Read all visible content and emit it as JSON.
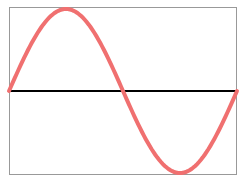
{
  "chart_data": {
    "type": "line",
    "title": "",
    "xlabel": "",
    "ylabel": "",
    "grid": false,
    "legend": null,
    "xlim": [
      0,
      6.2832
    ],
    "ylim": [
      -1,
      1
    ],
    "series": [
      {
        "name": "sin(x)",
        "color": "#f07070",
        "x": [
          0,
          0.7854,
          1.5708,
          2.3562,
          3.1416,
          3.927,
          4.7124,
          5.4978,
          6.2832
        ],
        "values": [
          0,
          0.7071,
          1,
          0.7071,
          0,
          -0.7071,
          -1,
          -0.7071,
          0
        ]
      }
    ],
    "baseline": {
      "y": 0,
      "color": "#000000"
    }
  },
  "style": {
    "frame_color": "#999999",
    "curve_color": "#f07070",
    "axis_color": "#000000"
  }
}
